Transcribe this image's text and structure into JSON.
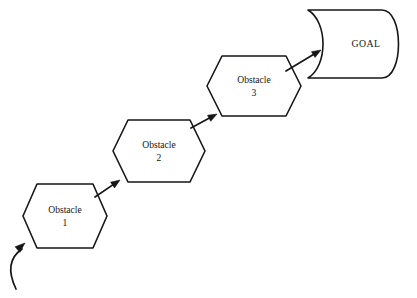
{
  "diagram": {
    "canvas": {
      "width": 417,
      "height": 298,
      "background": "#ffffff"
    },
    "stroke_color": "#161616",
    "fill_color": "#ffffff",
    "nodes": [
      {
        "id": "obstacle-1",
        "shape": "hexagon",
        "line1": "Obstacle",
        "line2": "1",
        "center_x": 65,
        "center_y": 216,
        "half_width": 42,
        "half_height": 32,
        "notch": 14
      },
      {
        "id": "obstacle-2",
        "shape": "hexagon",
        "line1": "Obstacle",
        "line2": "2",
        "center_x": 159,
        "center_y": 151,
        "half_width": 46,
        "half_height": 31,
        "notch": 15
      },
      {
        "id": "obstacle-3",
        "shape": "hexagon",
        "line1": "Obstacle",
        "line2": "3",
        "center_x": 254,
        "center_y": 86,
        "half_width": 47,
        "half_height": 30,
        "notch": 15
      },
      {
        "id": "goal",
        "shape": "delay-flag",
        "line1": "GOAL",
        "line2": "",
        "center_x": 366,
        "center_y": 44,
        "left_x": 308,
        "right_x": 400,
        "top_y": 10,
        "bottom_y": 78
      }
    ],
    "connectors": [
      {
        "id": "entry-arrow",
        "kind": "curved",
        "from_label": "start",
        "to_label": "obstacle-1",
        "start_x": 16,
        "start_y": 289,
        "control_x": 3,
        "control_y": 262,
        "end_x": 25,
        "end_y": 243
      },
      {
        "id": "arrow-1-to-2",
        "kind": "straight",
        "from_label": "obstacle-1",
        "to_label": "obstacle-2",
        "start_x": 95,
        "start_y": 197,
        "end_x": 120,
        "end_y": 180
      },
      {
        "id": "arrow-2-to-3",
        "kind": "straight",
        "from_label": "obstacle-2",
        "to_label": "obstacle-3",
        "start_x": 191,
        "start_y": 128,
        "end_x": 217,
        "end_y": 114
      },
      {
        "id": "arrow-3-to-goal",
        "kind": "straight",
        "from_label": "obstacle-3",
        "to_label": "goal",
        "start_x": 286,
        "start_y": 71,
        "end_x": 321,
        "end_y": 50
      }
    ]
  }
}
